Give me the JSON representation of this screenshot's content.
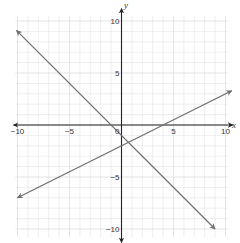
{
  "chart_data": {
    "type": "line",
    "title": "",
    "xlabel": "x",
    "ylabel": "y",
    "xlim": [
      -10,
      10
    ],
    "ylim": [
      -10,
      10
    ],
    "grid": true,
    "x_ticks": [
      "-10",
      "-5",
      "5",
      "10"
    ],
    "y_ticks": [
      "10",
      "5",
      "-5",
      "-10"
    ],
    "origin_label": "0",
    "series": [
      {
        "name": "line-1",
        "equation": "y = -x - 1",
        "slope": -1,
        "intercept": -1,
        "x": [
          -10.1,
          9
        ],
        "y": [
          9.1,
          -10
        ],
        "color": "#6e6e6e"
      },
      {
        "name": "line-2",
        "equation": "y = 0.5x - 2",
        "slope": 0.5,
        "intercept": -2,
        "x": [
          -10,
          10.6
        ],
        "y": [
          -7,
          3.3
        ],
        "color": "#6e6e6e"
      }
    ],
    "intersection": {
      "x": 0.67,
      "y": -1.67
    }
  },
  "colors": {
    "axis": "#222222",
    "grid": "#dddddd",
    "line": "#6e6e6e"
  }
}
